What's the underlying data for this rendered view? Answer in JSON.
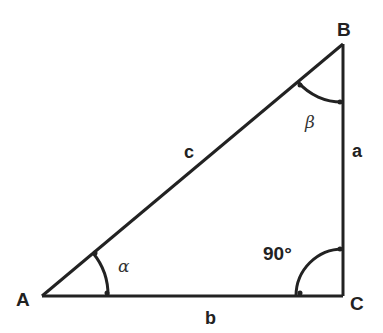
{
  "diagram": {
    "type": "right-triangle",
    "vertices": {
      "A": {
        "label": "A"
      },
      "B": {
        "label": "B"
      },
      "C": {
        "label": "C"
      }
    },
    "sides": {
      "a": {
        "label": "a"
      },
      "b": {
        "label": "b"
      },
      "c": {
        "label": "c"
      }
    },
    "angles": {
      "alpha": {
        "label": "α"
      },
      "beta": {
        "label": "β"
      },
      "right": {
        "label": "90°"
      }
    },
    "stroke_color": "#222222"
  }
}
